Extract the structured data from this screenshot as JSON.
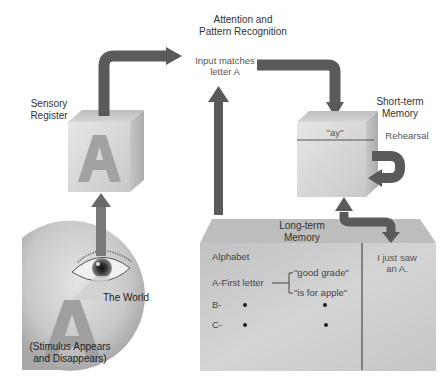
{
  "diagram": {
    "type": "information-processing-model-of-memory",
    "colors": {
      "arrow": "#5a5a5a",
      "arrow_light": "#777777",
      "box_front": "#d2d2d2",
      "box_top": "#c4c4c4",
      "box_side": "#b8b8b8",
      "letter_a": "#9a9a9a",
      "background": "#ffffff"
    },
    "attention": {
      "title_line1": "Attention and",
      "title_line2": "Pattern Recognition",
      "note_line1": "Input matches",
      "note_line2": "letter A"
    },
    "sensory_register": {
      "title_line1": "Sensory",
      "title_line2": "Register",
      "letter": "A"
    },
    "short_term_memory": {
      "title_line1": "Short-term",
      "title_line2": "Memory",
      "content": "\"ay\"",
      "rehearsal_label": "Rehearsal"
    },
    "long_term_memory": {
      "title_line1": "Long-term",
      "title_line2": "Memory",
      "semantic": {
        "heading": "Alphabet",
        "rows": [
          {
            "label": "A-First letter",
            "assoc": [
              "\"good grade\"",
              "\"is for apple\""
            ]
          },
          {
            "label": "B-",
            "dots": 2
          },
          {
            "label": "C-",
            "dots": 2
          }
        ]
      },
      "episodic_line1": "I just saw",
      "episodic_line2": "an A."
    },
    "world": {
      "label": "The World",
      "stimulus_line1": "(Stimulus Appears",
      "stimulus_line2": "and Disappears)",
      "letter": "A"
    }
  }
}
